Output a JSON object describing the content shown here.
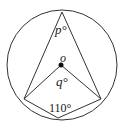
{
  "diagram": {
    "type": "circle-geometry",
    "circle": {
      "cx": 62,
      "cy": 65,
      "r": 55
    },
    "points": {
      "A": {
        "x": 62,
        "y": 12
      },
      "B": {
        "x": 24,
        "y": 99
      },
      "C": {
        "x": 101,
        "y": 99
      },
      "D": {
        "x": 58,
        "y": 118
      },
      "O": {
        "x": 61,
        "y": 65
      }
    },
    "labels": {
      "p": "p°",
      "o": "o",
      "q": "q°",
      "angle_d": "110°"
    },
    "colors": {
      "stroke": "#333333",
      "text": "#222222"
    }
  }
}
